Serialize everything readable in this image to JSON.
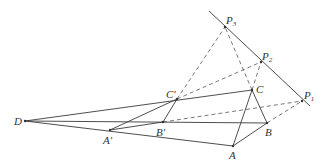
{
  "diagram": {
    "type": "geometry-desargues",
    "points": {
      "D": {
        "label": "D",
        "x": 25,
        "y": 121
      },
      "A1": {
        "label": "A′",
        "x": 110,
        "y": 130
      },
      "B1": {
        "label": "B′",
        "x": 163,
        "y": 122
      },
      "C1": {
        "label": "C′",
        "x": 177,
        "y": 99
      },
      "A": {
        "label": "A",
        "x": 233,
        "y": 146
      },
      "B": {
        "label": "B",
        "x": 267,
        "y": 123
      },
      "C": {
        "label": "C",
        "x": 252,
        "y": 90
      },
      "P1": {
        "label": "P",
        "sub": "1",
        "x": 302,
        "y": 101
      },
      "P2": {
        "label": "P",
        "sub": "2",
        "x": 261,
        "y": 62
      },
      "P3": {
        "label": "P",
        "sub": "3",
        "x": 225,
        "y": 27
      }
    },
    "labels": {
      "D": "D",
      "A_prime": "A′",
      "B_prime": "B′",
      "C_prime": "C′",
      "A": "A",
      "B": "B",
      "C": "C",
      "P": "P",
      "sub1": "1",
      "sub2": "2",
      "sub3": "3"
    },
    "colors": {
      "line": "#3a3a3a",
      "dash": "#555555",
      "text": "#333333",
      "background": "#ffffff"
    }
  }
}
